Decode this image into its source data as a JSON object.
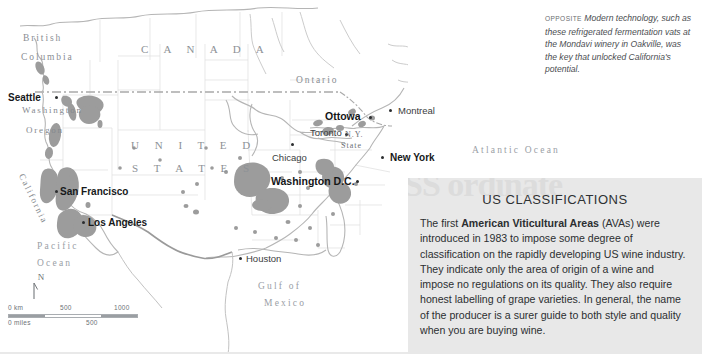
{
  "figure": {
    "type": "thematic-map"
  },
  "map": {
    "regions": [
      {
        "name": "CANADA",
        "kind": "country"
      },
      {
        "name": "UNITED",
        "kind": "country"
      },
      {
        "name": "STATES",
        "kind": "country"
      },
      {
        "name": "BRITISH",
        "kind": "province"
      },
      {
        "name": "COLUMBIA",
        "kind": "province"
      },
      {
        "name": "ONTARIO",
        "kind": "province"
      },
      {
        "name": "WASHINGTON",
        "kind": "state"
      },
      {
        "name": "OREGON",
        "kind": "state"
      },
      {
        "name": "CALIFORNIA",
        "kind": "state"
      },
      {
        "name": "N.Y. STATE",
        "kind": "state"
      }
    ],
    "oceans": [
      {
        "name": "ATLANTIC OCEAN"
      },
      {
        "name": "PACIFIC OCEAN"
      },
      {
        "name": "GULF OF MEXICO"
      }
    ],
    "cities": [
      {
        "name": "Seattle",
        "bold": true
      },
      {
        "name": "San Francisco",
        "bold": true
      },
      {
        "name": "Los Angeles",
        "bold": true
      },
      {
        "name": "Houston",
        "bold": false
      },
      {
        "name": "Chicago",
        "bold": false
      },
      {
        "name": "Toronto",
        "bold": false
      },
      {
        "name": "Montreal",
        "bold": false
      },
      {
        "name": "New York",
        "bold": true
      },
      {
        "name": "Ottowa",
        "bold": true
      },
      {
        "name": "Washington D.C.",
        "bold": true
      }
    ],
    "labels": {
      "canada": "C A N A D A",
      "united": "U N I T E D",
      "states": "S T A T E S",
      "british": "British",
      "columbia": "Columbia",
      "ontario": "Ontario",
      "washington_state": "Washington",
      "oregon": "Oregon",
      "california": "California",
      "ny_state_line1": "N.Y.",
      "ny_state_line2": "State",
      "atlantic": "Atlantic Ocean",
      "pacific_line1": "Pacific",
      "pacific_line2": "Ocean",
      "gulf_line1": "Gulf of",
      "gulf_line2": "Mexico",
      "seattle": "Seattle",
      "san_francisco": "San Francisco",
      "los_angeles": "Los Angeles",
      "houston": "Houston",
      "chicago": "Chicago",
      "toronto": "Toronto",
      "montreal": "Montreal",
      "new_york": "New York",
      "ottowa": "Ottowa",
      "washington_dc": "Washington D.C."
    },
    "scale": {
      "km_zero": "0 km",
      "km_mid": "500",
      "km_end": "1000",
      "miles_zero": "0 miles",
      "miles_mid": "500"
    },
    "compass": {
      "north": "N"
    },
    "colors": {
      "wine_region_fill": "#9b9b9b",
      "state_border": "#d8d8d8",
      "coastline": "#b9b9b9",
      "water_fill": "#ffffff",
      "label_grey": "#6f7378",
      "panel_background": "#e8e8e8"
    }
  },
  "caption": {
    "kicker": "opposite",
    "text": " Modern technology, such as these refrigerated fermentation vats at the Mondavi winery in Oakville, was the key that unlocked California's potential."
  },
  "panel": {
    "watermark": "SS ordinate",
    "heading": "US CLASSIFICATIONS",
    "paragraph_lead": "The first ",
    "paragraph_bold": "American Viticultural Areas",
    "paragraph_rest": " (AVAs) were introduced in 1983 to impose some degree of classification on the rapidly developing US wine industry. They indicate only the area of origin of a wine and impose no regulations on its quality. They also require honest labelling of grape varieties. In general, the name of the producer is a surer guide to both style and quality when you are buying wine."
  }
}
